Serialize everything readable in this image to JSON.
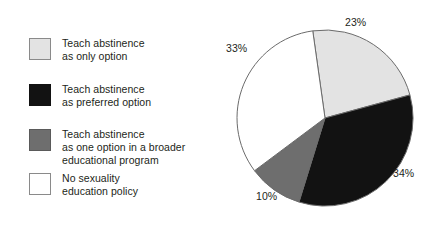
{
  "chart_data": {
    "type": "pie",
    "title": "",
    "subtitle": "",
    "xlabel": "",
    "ylabel": "",
    "grid": false,
    "legend_position": "left",
    "units": "percent",
    "start_angle_deg": -8,
    "direction": "clockwise",
    "categories": [
      "Teach abstinence as only option",
      "Teach abstinence as preferred option",
      "Teach abstinence as one option in a broader educational program",
      "No sexuality education policy"
    ],
    "values": [
      23,
      34,
      10,
      33
    ],
    "labels": [
      "23%",
      "34%",
      "10%",
      "33%"
    ],
    "colors": [
      "#e3e3e3",
      "#121212",
      "#6e6e6e",
      "#ffffff"
    ],
    "stroke_color": "#6b6b6b",
    "total": 100
  },
  "legend": {
    "items": [
      {
        "label": "Teach abstinence\nas only option",
        "swatch_fill": "#e3e3e3",
        "swatch_border": "#8a8a8a",
        "value_label": "23%"
      },
      {
        "label": "Teach abstinence\nas preferred option",
        "swatch_fill": "#121212",
        "swatch_border": "#121212",
        "value_label": "34%"
      },
      {
        "label": "Teach abstinence\nas one option in a broader\neducational program",
        "swatch_fill": "#6e6e6e",
        "swatch_border": "#5a5a5a",
        "value_label": "10%"
      },
      {
        "label": "No sexuality\neducation policy",
        "swatch_fill": "#ffffff",
        "swatch_border": "#8a8a8a",
        "value_label": "33%"
      }
    ]
  },
  "pie": {
    "center_x": 104,
    "center_y": 118,
    "radius": 88,
    "percent_labels": [
      "23%",
      "34%",
      "10%",
      "33%"
    ]
  }
}
